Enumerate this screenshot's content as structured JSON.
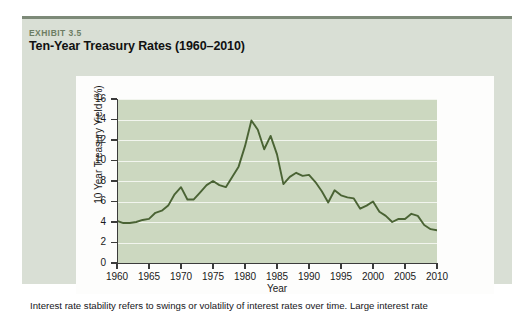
{
  "exhibit": {
    "label": "EXHIBIT 3.5",
    "title": "Ten-Year Treasury Rates (1960–2010)",
    "box_color": "#d9dfd5",
    "rule_color": "#7d8a78",
    "label_color": "#6d7d63"
  },
  "caption": {
    "text": "Interest rate stability refers to swings or volatility of interest rates over time. Large interest rate"
  },
  "chart_data": {
    "type": "line",
    "title": "Ten-Year Treasury Rates (1960–2010)",
    "xlabel": "Year",
    "ylabel": "10 Year Treasury Yield (%)",
    "xlim": [
      1960,
      2010
    ],
    "ylim": [
      0,
      16
    ],
    "ytick_labels": [
      "0",
      "2",
      "4",
      "6",
      "8",
      "10",
      "12",
      "14",
      "16"
    ],
    "ytick_values": [
      0,
      2,
      4,
      6,
      8,
      10,
      12,
      14,
      16
    ],
    "xtick_labels": [
      "1960",
      "1965",
      "1970",
      "1975",
      "1980",
      "1985",
      "1990",
      "1995",
      "2000",
      "2005",
      "2010"
    ],
    "xtick_values": [
      1960,
      1965,
      1970,
      1975,
      1980,
      1985,
      1990,
      1995,
      2000,
      2005,
      2010
    ],
    "grid": true,
    "grid_color": "#f2f5ee",
    "legend": null,
    "plot_bg": "#ccd8c0",
    "series": [
      {
        "name": "10 Year Treasury Yield",
        "color": "#4a6334",
        "x": [
          1960,
          1961,
          1962,
          1963,
          1964,
          1965,
          1966,
          1967,
          1968,
          1969,
          1970,
          1971,
          1972,
          1973,
          1974,
          1975,
          1976,
          1977,
          1978,
          1979,
          1980,
          1981,
          1982,
          1983,
          1984,
          1985,
          1986,
          1987,
          1988,
          1989,
          1990,
          1991,
          1992,
          1993,
          1994,
          1995,
          1996,
          1997,
          1998,
          1999,
          2000,
          2001,
          2002,
          2003,
          2004,
          2005,
          2006,
          2007,
          2008,
          2009,
          2010
        ],
        "values": [
          4.1,
          3.9,
          3.9,
          4.0,
          4.2,
          4.3,
          4.9,
          5.1,
          5.6,
          6.7,
          7.4,
          6.2,
          6.2,
          6.9,
          7.6,
          8.0,
          7.6,
          7.4,
          8.4,
          9.4,
          11.4,
          13.9,
          13.0,
          11.1,
          12.4,
          10.6,
          7.7,
          8.4,
          8.8,
          8.5,
          8.6,
          7.9,
          7.0,
          5.9,
          7.1,
          6.6,
          6.4,
          6.3,
          5.3,
          5.6,
          6.0,
          5.0,
          4.6,
          4.0,
          4.3,
          4.3,
          4.8,
          4.6,
          3.7,
          3.3,
          3.2
        ]
      }
    ]
  }
}
